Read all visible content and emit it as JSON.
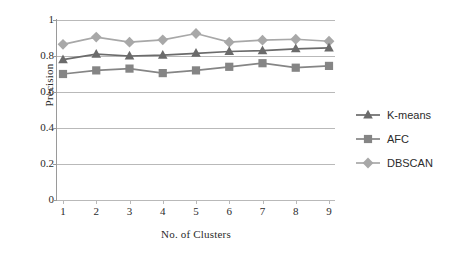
{
  "chart_data": {
    "type": "line",
    "title": "",
    "xlabel": "No. of Clusters",
    "ylabel": "Precision",
    "categories": [
      "1",
      "2",
      "3",
      "4",
      "5",
      "6",
      "7",
      "8",
      "9"
    ],
    "x": [
      1,
      2,
      3,
      4,
      5,
      6,
      7,
      8,
      9
    ],
    "xlim": [
      1,
      9
    ],
    "ylim": [
      0,
      1
    ],
    "yticks": [
      "0",
      "0.2",
      "0.4",
      "0.6",
      "0.8",
      "1"
    ],
    "ytick_values": [
      0,
      0.2,
      0.4,
      0.6,
      0.8,
      1
    ],
    "grid": "horizontal",
    "legend_position": "right",
    "series": [
      {
        "name": "K-means",
        "marker": "triangle",
        "color": "#6b6b6b",
        "values": [
          0.78,
          0.81,
          0.8,
          0.805,
          0.815,
          0.825,
          0.83,
          0.84,
          0.845
        ]
      },
      {
        "name": "AFC",
        "marker": "square",
        "color": "#858585",
        "values": [
          0.7,
          0.72,
          0.73,
          0.705,
          0.72,
          0.74,
          0.76,
          0.735,
          0.745
        ]
      },
      {
        "name": "DBSCAN",
        "marker": "diamond",
        "color": "#a8a8a8",
        "values": [
          0.865,
          0.905,
          0.877,
          0.89,
          0.925,
          0.877,
          0.888,
          0.893,
          0.882
        ]
      }
    ]
  },
  "colors": {
    "gridline": "#b9b9b9",
    "axis": "#9a9a9a",
    "text": "#2b2b2b",
    "background": "#ffffff"
  }
}
